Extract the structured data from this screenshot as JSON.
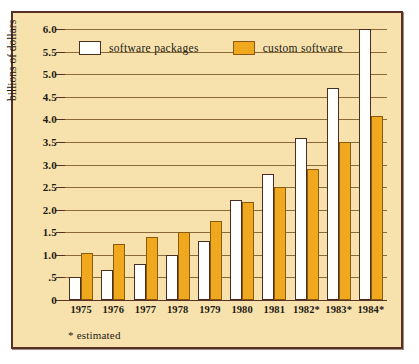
{
  "chart_data": {
    "type": "bar",
    "title": "",
    "subtitle": "",
    "xlabel": "",
    "ylabel": "billions of dollars",
    "ylim": [
      0,
      6.0
    ],
    "grid": true,
    "legend_position": "top-left-inside",
    "categories": [
      "1975",
      "1976",
      "1977",
      "1978",
      "1979",
      "1980",
      "1981",
      "1982*",
      "1983*",
      "1984*"
    ],
    "ytick_labels": [
      "0",
      ".5",
      "1.0",
      "1.5",
      "2.0",
      "2.5",
      "3.0",
      "3.5",
      "4.0",
      "4.5",
      "5.0",
      "5.5",
      "6.0"
    ],
    "ytick_values": [
      0,
      0.5,
      1.0,
      1.5,
      2.0,
      2.5,
      3.0,
      3.5,
      4.0,
      4.5,
      5.0,
      5.5,
      6.0
    ],
    "series": [
      {
        "name": "software packages",
        "color": "#ffffff",
        "values": [
          0.5,
          0.67,
          0.8,
          1.0,
          1.3,
          2.22,
          2.8,
          3.58,
          4.7,
          6.0
        ]
      },
      {
        "name": "custom software",
        "color": "#f0a81e",
        "values": [
          1.05,
          1.25,
          1.4,
          1.5,
          1.75,
          2.17,
          2.5,
          2.9,
          3.5,
          4.07
        ]
      }
    ],
    "annotations": [
      "* estimated"
    ]
  },
  "legend": {
    "items": [
      {
        "label": "software packages",
        "color": "#ffffff"
      },
      {
        "label": "custom software",
        "color": "#f0a81e"
      }
    ]
  },
  "axis": {
    "y_title": "billions of dollars"
  },
  "footnote": {
    "text": "* estimated"
  },
  "colors": {
    "background": "#f7e2ae",
    "border": "#5a3026",
    "gridline": "#8a6a36",
    "packages": "#ffffff",
    "custom": "#f0a81e",
    "text": "#231a12"
  }
}
